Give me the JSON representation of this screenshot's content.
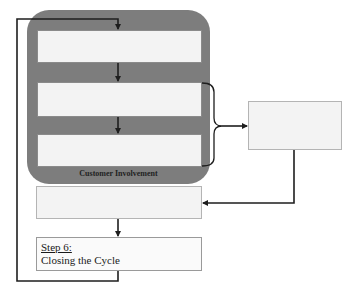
{
  "diagram": {
    "group": {
      "label": "Customer Involvement",
      "fill_color": "#7d7d7d"
    },
    "steps": [
      {
        "id": "step-1",
        "label": "",
        "text": ""
      },
      {
        "id": "step-2",
        "label": "",
        "text": ""
      },
      {
        "id": "step-3",
        "label": "",
        "text": ""
      },
      {
        "id": "step-4",
        "label": "",
        "text": ""
      },
      {
        "id": "step-5",
        "label": "",
        "text": ""
      },
      {
        "id": "step-6",
        "label": "Step 6:",
        "text": "Closing the Cycle"
      }
    ],
    "connectors": [
      {
        "from": "step-6",
        "to": "step-1",
        "type": "loop-back"
      },
      {
        "from": "step-1",
        "to": "step-2",
        "type": "arrow"
      },
      {
        "from": "step-2",
        "to": "step-3",
        "type": "arrow"
      },
      {
        "from": "step-2..step-3",
        "to": "step-4",
        "type": "brace-arrow"
      },
      {
        "from": "step-4",
        "to": "step-5",
        "type": "elbow-arrow"
      },
      {
        "from": "step-5",
        "to": "step-6",
        "type": "arrow"
      }
    ],
    "line_color": "#1e1e1e",
    "box_fill": "#f3f3f3"
  }
}
